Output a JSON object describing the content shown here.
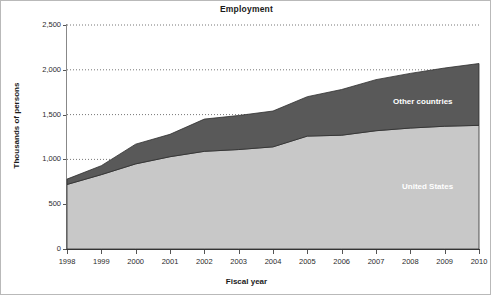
{
  "chart_data": {
    "type": "area",
    "title": "Employment",
    "xlabel": "Fiscal year",
    "ylabel": "Thousands of persons",
    "stacked": true,
    "grid": "horizontal-dotted",
    "legend_position": "inline-labels",
    "x": [
      1998,
      1999,
      2000,
      2001,
      2002,
      2003,
      2004,
      2005,
      2006,
      2007,
      2008,
      2009,
      2010
    ],
    "categories": [
      "1998",
      "1999",
      "2000",
      "2001",
      "2002",
      "2003",
      "2004",
      "2005",
      "2006",
      "2007",
      "2008",
      "2009",
      "2010"
    ],
    "xlim": [
      1998,
      2010
    ],
    "ylim": [
      0,
      2500
    ],
    "yticks": [
      0,
      500,
      1000,
      1500,
      2000,
      2500
    ],
    "ytick_labels": [
      "0",
      "500",
      "1,000",
      "1,500",
      "2,000",
      "2,500"
    ],
    "series": [
      {
        "name": "United States",
        "color": "#c8c8c8",
        "values": [
          720,
          830,
          950,
          1030,
          1090,
          1110,
          1140,
          1260,
          1270,
          1320,
          1350,
          1370,
          1380
        ]
      },
      {
        "name": "Other countries",
        "color": "#595959",
        "values": [
          60,
          100,
          220,
          250,
          360,
          380,
          400,
          440,
          510,
          570,
          610,
          650,
          690
        ]
      }
    ],
    "totals": [
      780,
      930,
      1170,
      1280,
      1450,
      1490,
      1540,
      1700,
      1780,
      1890,
      1960,
      2020,
      2070
    ]
  },
  "labels": {
    "other_countries": "Other countries",
    "united_states": "United States"
  }
}
